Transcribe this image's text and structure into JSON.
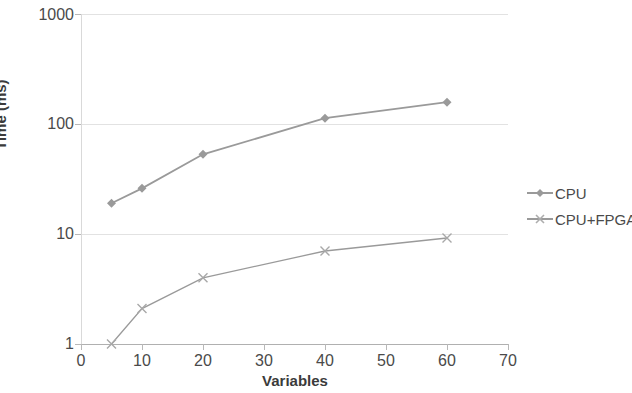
{
  "chart_data": {
    "type": "line",
    "title": "",
    "xlabel": "Variables",
    "ylabel": "Time (ms)",
    "yscale": "log",
    "ylim": [
      1,
      1000
    ],
    "xlim": [
      0,
      70
    ],
    "grid": true,
    "legend_position": "right",
    "x": [
      5,
      10,
      20,
      40,
      60
    ],
    "xticks": [
      "0",
      "10",
      "20",
      "30",
      "40",
      "50",
      "60",
      "70"
    ],
    "yticks": [
      "1",
      "10",
      "100",
      "1000"
    ],
    "series": [
      {
        "name": "CPU",
        "marker": "diamond",
        "color": "#9a9a9a",
        "values": [
          19,
          26,
          53,
          113,
          158
        ]
      },
      {
        "name": "CPU+FPGA",
        "marker": "x-cross",
        "color": "#9a9a9a",
        "values": [
          1,
          2.1,
          4,
          7,
          9.2
        ]
      }
    ]
  },
  "axes": {
    "y_title": "Time (ms)",
    "x_title": "Variables",
    "y_tick_labels": [
      "1000",
      "100",
      "10",
      "1"
    ],
    "x_tick_labels": [
      "0",
      "10",
      "20",
      "30",
      "40",
      "50",
      "60",
      "70"
    ]
  },
  "legend": {
    "entries": [
      {
        "label": "CPU"
      },
      {
        "label": "CPU+FPGA"
      }
    ]
  },
  "colors": {
    "series_line": "#9a9a9a",
    "gridline": "#e2e2e2",
    "axis": "#b8b8b8",
    "tick_text": "#4a4a4a",
    "title_text": "#3b3b3b",
    "background": "#ffffff"
  }
}
